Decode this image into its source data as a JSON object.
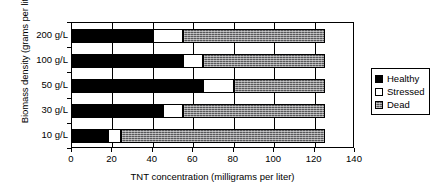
{
  "chart_data": {
    "type": "bar",
    "orientation": "horizontal",
    "stacked": true,
    "title": "",
    "xlabel": "TNT concentration (milligrams per liter)",
    "ylabel": "Biomass density (grams per liter)",
    "categories": [
      "200 g/L",
      "100 g/L",
      "50 g/L",
      "30 g/L",
      "10 g/L"
    ],
    "xlim": [
      0,
      140
    ],
    "xticks": [
      0,
      20,
      40,
      60,
      80,
      100,
      120,
      140
    ],
    "xtick_labels": [
      "0",
      "20",
      "40",
      "60",
      "80",
      "100",
      "120",
      "140"
    ],
    "grid": true,
    "legend_position": "right",
    "series": [
      {
        "name": "Healthy",
        "color": "#000000",
        "values": [
          40,
          55,
          65,
          45,
          18
        ]
      },
      {
        "name": "Stressed",
        "color": "#ffffff",
        "values": [
          15,
          10,
          15,
          10,
          6
        ]
      },
      {
        "name": "Dead",
        "color": "#58585a",
        "values": [
          70,
          60,
          45,
          70,
          101
        ]
      }
    ],
    "bar_totals": [
      125,
      125,
      125,
      125,
      125
    ]
  },
  "legend": {
    "items": [
      {
        "label": "Healthy"
      },
      {
        "label": "Stressed"
      },
      {
        "label": "Dead"
      }
    ]
  }
}
